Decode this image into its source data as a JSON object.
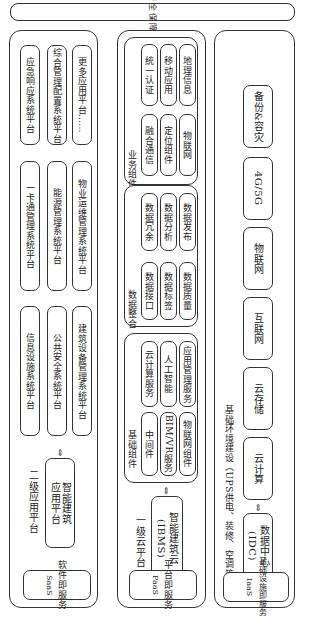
{
  "banner": {
    "label": "统一安全保障体系"
  },
  "columns": [
    {
      "id": "saas",
      "layer_tag": "SaaS 软件即服务",
      "layer_tag_lines": [
        "软件即服务",
        "SaaS"
      ],
      "title": "二级应用平台",
      "core": "智能建筑 应用平台",
      "core_lines": [
        "智能建筑",
        "应用平台"
      ],
      "platforms": [
        [
          "应急响应系统平台",
          "一卡通管理系统平台",
          "信息设施系统平台"
        ],
        [
          "综合管理配置系统平台",
          "能源管理系统平台",
          "公共安全系统平台"
        ],
        [
          "更多应用平台……",
          "物业运维管理系统平台",
          "建筑设备管理系统平台"
        ]
      ]
    },
    {
      "id": "paas",
      "layer_tag": "PaaS 平台即服务",
      "layer_tag_lines": [
        "平台即服务",
        "PaaS"
      ],
      "title": "一级云平台",
      "core": "智能建筑云 (IBMS)",
      "core_lines": [
        "智能建筑云",
        "(IBMS)"
      ],
      "groups": [
        {
          "title": "业务组件",
          "rows": [
            [
              "统一认证",
              "融合通信"
            ],
            [
              "移动应用",
              "定位组件"
            ],
            [
              "地理信息",
              "物联网"
            ]
          ]
        },
        {
          "title": "数据整合",
          "rows": [
            [
              "数据冗余",
              "数据接口"
            ],
            [
              "数据分析",
              "数据标签"
            ],
            [
              "数据发布",
              "数据质量"
            ]
          ]
        },
        {
          "title": "基础组件",
          "rows": [
            [
              "云计算服务",
              "中间件"
            ],
            [
              "人工智能",
              "BIM/VR服务"
            ],
            [
              "应用管理服务",
              "物联网组件"
            ]
          ]
        }
      ]
    },
    {
      "id": "iaas",
      "layer_tag": "IaaS 基础设施即服务",
      "layer_tag_lines": [
        "基础设施即服务",
        "IaaS"
      ],
      "title": "基础环境建设（UPS供电、装修、空调等）",
      "core": "数据中心 (IDC)",
      "core_lines": [
        "数据中心",
        "(IDC)"
      ],
      "items": [
        "备份&容灾",
        "4G/5G",
        "物联网",
        "互联网",
        "云存储",
        "云计算"
      ]
    }
  ],
  "arrows": {
    "bidirectional": "⇔"
  }
}
